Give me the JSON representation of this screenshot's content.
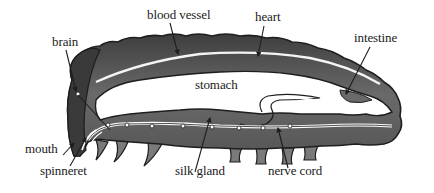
{
  "diagram": {
    "colors": {
      "body_dark": "#4a4a4a",
      "body_mid": "#6e6e6e",
      "body_light": "#8c8c8c",
      "outline": "#1e1e1e",
      "cavity": "#ffffff",
      "text": "#1a1a1a"
    },
    "labels": {
      "blood_vessel": "blood vessel",
      "heart": "heart",
      "brain": "brain",
      "intestine": "intestine",
      "stomach": "stomach",
      "mouth": "mouth",
      "spinneret": "spinneret",
      "silk_gland": "silk gland",
      "nerve_cord": "nerve cord"
    }
  }
}
